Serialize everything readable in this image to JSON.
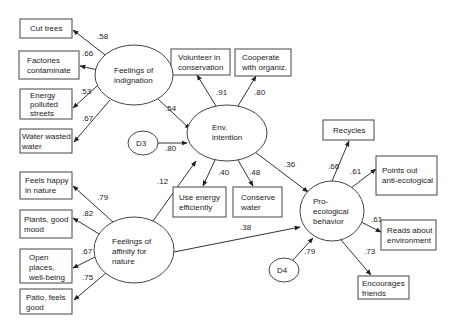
{
  "diagram": {
    "type": "structural-equation-model",
    "latent": {
      "indignation": {
        "lines": [
          "Feelings of",
          "indignation"
        ]
      },
      "affinity": {
        "lines": [
          "Feelings of",
          "affinity for",
          "nature"
        ]
      },
      "intention": {
        "lines": [
          "Env.",
          "intention"
        ]
      },
      "behavior": {
        "lines": [
          "Pro-",
          "ecological",
          "behavior"
        ]
      },
      "d3": {
        "lines": [
          "D3"
        ]
      },
      "d4": {
        "lines": [
          "D4"
        ]
      }
    },
    "indicators": {
      "cut_trees": {
        "lines": [
          "Cut trees"
        ]
      },
      "factories": {
        "lines": [
          "Factories",
          "contaminate"
        ]
      },
      "energy_polluted": {
        "lines": [
          "Energy",
          "polluted",
          "streets"
        ]
      },
      "water_wasted": {
        "lines": [
          "Water wasted",
          "water"
        ]
      },
      "feels_happy": {
        "lines": [
          "Feels happy",
          "in nature"
        ]
      },
      "plants": {
        "lines": [
          "Plants, good",
          "mood"
        ]
      },
      "open_places": {
        "lines": [
          "Open",
          "places,",
          "well-being"
        ]
      },
      "patio": {
        "lines": [
          "Patio, feels",
          "good"
        ]
      },
      "volunteer": {
        "lines": [
          "Volunteer in",
          "conservation"
        ]
      },
      "cooperate": {
        "lines": [
          "Cooperate",
          "with organiz."
        ]
      },
      "use_energy": {
        "lines": [
          "Use energy",
          "efficiently"
        ]
      },
      "conserve_water": {
        "lines": [
          "Conserve",
          "water"
        ]
      },
      "recycles": {
        "lines": [
          "Recycles"
        ]
      },
      "points_out": {
        "lines": [
          "Points out",
          "anti-ecological"
        ]
      },
      "reads_about": {
        "lines": [
          "Reads about",
          "environment"
        ]
      },
      "encourages": {
        "lines": [
          "Encourages",
          "friends"
        ]
      }
    },
    "coefficients": {
      "indignation_cut_trees": ".58",
      "indignation_factories": ".66",
      "indignation_energy_polluted": ".53",
      "indignation_water_wasted": ".67",
      "indignation_intention": ".54",
      "d3_intention": ".80",
      "intention_volunteer": ".91",
      "intention_cooperate": ".80",
      "intention_use_energy": ".40",
      "intention_conserve_water": ".48",
      "intention_behavior": ".36",
      "affinity_intention": ".12",
      "affinity_feels_happy": ".79",
      "affinity_plants": ".82",
      "affinity_open_places": ".67",
      "affinity_patio": ".75",
      "affinity_behavior": ".38",
      "d4_behavior": ".79",
      "behavior_recycles": ".66",
      "behavior_points_out": ".61",
      "behavior_reads_about": ".61",
      "behavior_encourages": ".73"
    }
  }
}
